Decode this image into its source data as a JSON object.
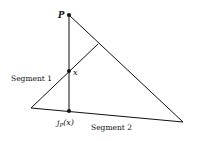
{
  "diagram": {
    "points": {
      "P": {
        "label": "P",
        "x": 69,
        "y": 15
      },
      "x": {
        "label": "x",
        "x": 69,
        "y": 71
      },
      "jp": {
        "label": "jP(x)",
        "label_main": "j",
        "label_sub": "P",
        "label_arg": "(x)",
        "x": 69,
        "y": 111
      }
    },
    "vertices": {
      "bottom_left": {
        "x": 31,
        "y": 108
      },
      "bottom_right": {
        "x": 183,
        "y": 122
      },
      "seg1_top": {
        "x": 98,
        "y": 44
      }
    },
    "labels": {
      "segment1": "Segment 1",
      "segment2": "Segment 2"
    },
    "colors": {
      "stroke": "#111111",
      "background": "#ffffff"
    }
  }
}
